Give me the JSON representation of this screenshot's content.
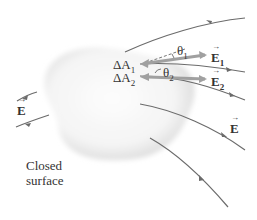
{
  "diagram": {
    "type": "physics-gauss-law-closed-surface",
    "labels": {
      "dA1": "ΔA",
      "dA1_sub": "1",
      "dA2": "ΔA",
      "dA2_sub": "2",
      "theta1": "θ",
      "theta1_sub": "1",
      "theta2": "θ",
      "theta2_sub": "2",
      "E1": "E",
      "E1_sub": "1",
      "E2": "E",
      "E2_sub": "2",
      "E_left": "E",
      "E_right": "E",
      "surface_line1": "Closed",
      "surface_line2": "surface"
    },
    "colors": {
      "field_line": "#6b6b6b",
      "area_vector": "#9a9a9a",
      "surface_shade": "#e6e6e6",
      "text": "#333333"
    }
  }
}
